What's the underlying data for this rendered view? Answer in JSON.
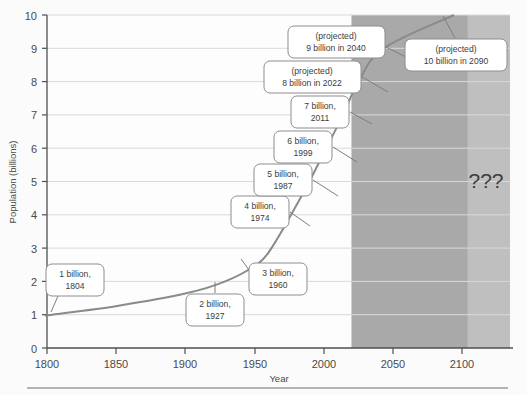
{
  "chart_data": {
    "type": "line",
    "title": "",
    "xlabel": "Year",
    "ylabel": "Population (billions)",
    "xlim": [
      1800,
      2130
    ],
    "ylim": [
      0,
      10
    ],
    "xticks": [
      1800,
      1850,
      1900,
      1950,
      2000,
      2050,
      2100
    ],
    "yticks": [
      0,
      1,
      2,
      3,
      4,
      5,
      6,
      7,
      8,
      9,
      10
    ],
    "grid": true,
    "legend": "none",
    "series": [
      {
        "name": "World population",
        "x": [
          1800,
          1804,
          1850,
          1900,
          1927,
          1950,
          1960,
          1974,
          1987,
          1999,
          2011,
          2022,
          2040,
          2090
        ],
        "y": [
          0.98,
          1.0,
          1.26,
          1.65,
          2.0,
          2.52,
          3.0,
          4.0,
          5.0,
          6.0,
          7.0,
          8.0,
          9.0,
          10.0
        ]
      }
    ],
    "annotations": [
      {
        "label": "1 billion,\n1804",
        "line1": "1 billion,",
        "line2": "1804",
        "x": 1804,
        "y": 1
      },
      {
        "label": "2 billion,\n1927",
        "line1": "2 billion,",
        "line2": "1927",
        "x": 1927,
        "y": 2
      },
      {
        "label": "3 billion,\n1960",
        "line1": "3 billion,",
        "line2": "1960",
        "x": 1960,
        "y": 3
      },
      {
        "label": "4 billion,\n1974",
        "line1": "4 billion,",
        "line2": "1974",
        "x": 1974,
        "y": 4
      },
      {
        "label": "5 billion,\n1987",
        "line1": "5 billion,",
        "line2": "1987",
        "x": 1987,
        "y": 5
      },
      {
        "label": "6 billion,\n1999",
        "line1": "6 billion,",
        "line2": "1999",
        "x": 1999,
        "y": 6
      },
      {
        "label": "7 billion,\n2011",
        "line1": "7 billion,",
        "line2": "2011",
        "x": 2011,
        "y": 7
      },
      {
        "label": "(projected)\n8 billion in 2022",
        "line1": "(projected)",
        "line2": "8 billion in 2022",
        "x": 2022,
        "y": 8
      },
      {
        "label": "(projected)\n9 billion in 2040",
        "line1": "(projected)",
        "line2": "9 billion in 2040",
        "x": 2040,
        "y": 9
      },
      {
        "label": "(projected)\n10 billion in 2090",
        "line1": "(projected)",
        "line2": "10 billion in 2090",
        "x": 2090,
        "y": 10
      }
    ],
    "shaded_regions": [
      {
        "name": "projected-band",
        "from": 2017,
        "to": 2100,
        "color": "#a9a9a9"
      },
      {
        "name": "unknown-band",
        "from": 2100,
        "to": 2130,
        "color": "#bfbfbf",
        "label": "???"
      }
    ],
    "unknown_marker": "???",
    "colors": {
      "line": "#8a8a8a",
      "grid": "#d8d8d8",
      "axis": "#555555",
      "background": "#fbfbfb",
      "projected_fill": "#a9a9a9",
      "unknown_fill": "#bfbfbf",
      "callout_border": "#8d8d8d",
      "callout_fill": "#ffffff"
    }
  },
  "axes": {
    "y_title": "Population (billions)",
    "x_title": "Year",
    "y_tick_labels": [
      "0",
      "1",
      "2",
      "3",
      "4",
      "5",
      "6",
      "7",
      "8",
      "9",
      "10"
    ],
    "x_tick_labels": [
      "1800",
      "1850",
      "1900",
      "1950",
      "2000",
      "2050",
      "2100"
    ]
  },
  "footer": {
    "rule": ""
  }
}
